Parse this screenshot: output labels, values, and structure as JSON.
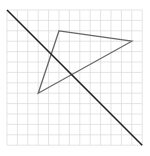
{
  "figure": {
    "grid": {
      "columns": 13,
      "rows": 13,
      "color": "#d9d9d9"
    },
    "line_of_reflection": {
      "from": [
        0,
        13
      ],
      "to": [
        13,
        0
      ],
      "color": "#222222"
    },
    "triangle": {
      "vertices": [
        [
          5,
          11
        ],
        [
          12,
          10
        ],
        [
          3,
          5
        ]
      ],
      "color": "#666666"
    }
  }
}
